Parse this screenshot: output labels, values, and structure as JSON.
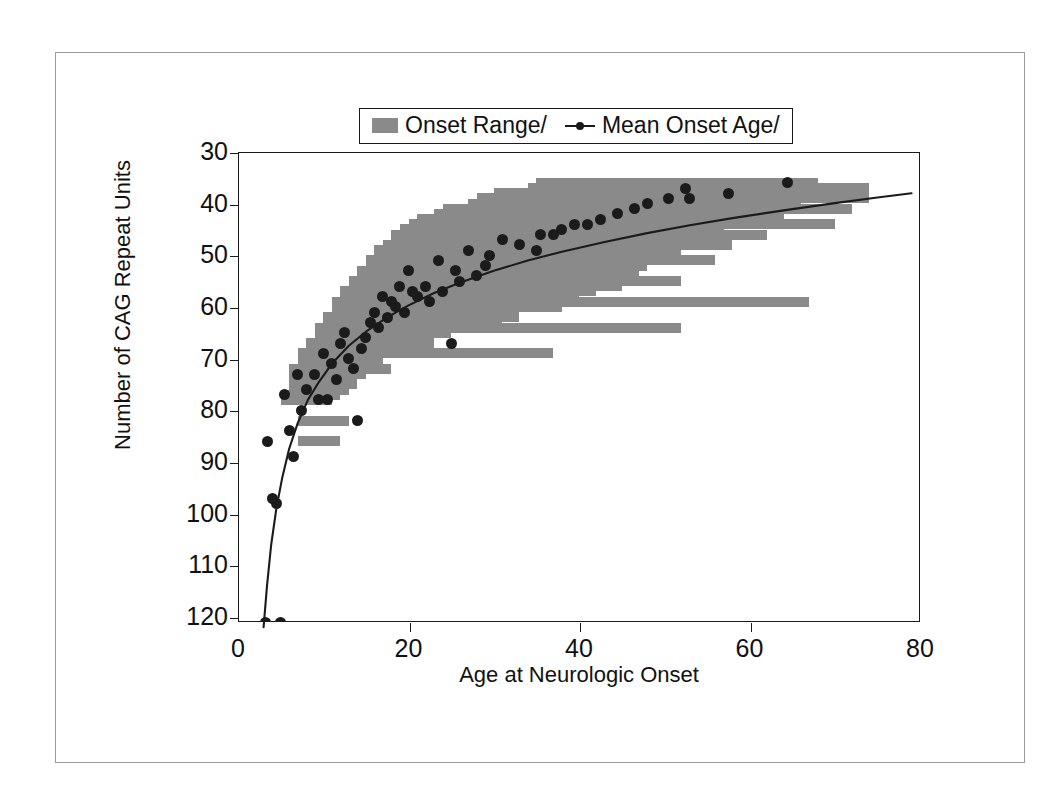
{
  "figure": {
    "background": "#ffffff",
    "frame_color": "#9a9a9a",
    "axis_color": "#1a1a1a"
  },
  "legend": {
    "position": "top-center",
    "items": [
      {
        "label": "Onset Range/",
        "marker": "swatch",
        "color": "#8a8a8a"
      },
      {
        "label": "Mean Onset Age/",
        "marker": "line-point",
        "color": "#1b1b1b"
      }
    ]
  },
  "chart_data": {
    "type": "scatter",
    "title": "",
    "xlabel": "Age at Neurologic Onset",
    "ylabel": "Number of CAG Repeat Units",
    "xlim": [
      0,
      80
    ],
    "ylim": [
      30,
      121
    ],
    "y_inverted": true,
    "grid": false,
    "xticks": [
      0,
      20,
      40,
      60,
      80
    ],
    "yticks": [
      30,
      40,
      50,
      60,
      70,
      80,
      90,
      100,
      110,
      120
    ],
    "bar_color": "#8a8a8a",
    "point_color": "#1b1b1b",
    "line_color": "#1b1b1b",
    "series": [
      {
        "name": "Onset Range/",
        "type": "range-bars",
        "note": "Horizontal age-range bar for each CAG repeat length",
        "bars": [
          {
            "cag": 36,
            "age_min": 35.0,
            "age_max": 68.0
          },
          {
            "cag": 37,
            "age_min": 34.0,
            "age_max": 74.0
          },
          {
            "cag": 38,
            "age_min": 30.0,
            "age_max": 72.0
          },
          {
            "cag": 39,
            "age_min": 28.0,
            "age_max": 74.0
          },
          {
            "cag": 40,
            "age_min": 27.0,
            "age_max": 66.0
          },
          {
            "cag": 41,
            "age_min": 24.0,
            "age_max": 72.0
          },
          {
            "cag": 42,
            "age_min": 23.0,
            "age_max": 60.0
          },
          {
            "cag": 43,
            "age_min": 21.0,
            "age_max": 64.0
          },
          {
            "cag": 44,
            "age_min": 20.0,
            "age_max": 70.0
          },
          {
            "cag": 45,
            "age_min": 19.0,
            "age_max": 57.0
          },
          {
            "cag": 46,
            "age_min": 18.0,
            "age_max": 62.0
          },
          {
            "cag": 47,
            "age_min": 18.0,
            "age_max": 55.0
          },
          {
            "cag": 48,
            "age_min": 17.0,
            "age_max": 58.0
          },
          {
            "cag": 49,
            "age_min": 16.0,
            "age_max": 52.0
          },
          {
            "cag": 50,
            "age_min": 16.0,
            "age_max": 50.0
          },
          {
            "cag": 51,
            "age_min": 15.0,
            "age_max": 56.0
          },
          {
            "cag": 52,
            "age_min": 15.0,
            "age_max": 48.0
          },
          {
            "cag": 53,
            "age_min": 14.0,
            "age_max": 47.0
          },
          {
            "cag": 54,
            "age_min": 14.0,
            "age_max": 44.0
          },
          {
            "cag": 55,
            "age_min": 13.0,
            "age_max": 52.0
          },
          {
            "cag": 56,
            "age_min": 13.0,
            "age_max": 45.0
          },
          {
            "cag": 57,
            "age_min": 12.0,
            "age_max": 42.0
          },
          {
            "cag": 58,
            "age_min": 12.0,
            "age_max": 40.0
          },
          {
            "cag": 59,
            "age_min": 11.0,
            "age_max": 67.0
          },
          {
            "cag": 60,
            "age_min": 11.0,
            "age_max": 38.0
          },
          {
            "cag": 61,
            "age_min": 11.0,
            "age_max": 27.0
          },
          {
            "cag": 62,
            "age_min": 10.0,
            "age_max": 33.0
          },
          {
            "cag": 63,
            "age_min": 10.0,
            "age_max": 31.0
          },
          {
            "cag": 64,
            "age_min": 9.0,
            "age_max": 52.0
          },
          {
            "cag": 65,
            "age_min": 9.0,
            "age_max": 25.0
          },
          {
            "cag": 66,
            "age_min": 9.0,
            "age_max": 20.0
          },
          {
            "cag": 67,
            "age_min": 8.0,
            "age_max": 23.0
          },
          {
            "cag": 68,
            "age_min": 8.0,
            "age_max": 19.0
          },
          {
            "cag": 69,
            "age_min": 7.0,
            "age_max": 37.0
          },
          {
            "cag": 70,
            "age_min": 7.0,
            "age_max": 17.0
          },
          {
            "cag": 71,
            "age_min": 7.0,
            "age_max": 16.0
          },
          {
            "cag": 72,
            "age_min": 6.0,
            "age_max": 18.0
          },
          {
            "cag": 73,
            "age_min": 6.0,
            "age_max": 15.0
          },
          {
            "cag": 75,
            "age_min": 6.0,
            "age_max": 14.0
          },
          {
            "cag": 76,
            "age_min": 6.0,
            "age_max": 13.0
          },
          {
            "cag": 77,
            "age_min": 5.0,
            "age_max": 12.0
          },
          {
            "cag": 78,
            "age_min": 5.0,
            "age_max": 11.0
          },
          {
            "cag": 82,
            "age_min": 7.0,
            "age_max": 13.0
          },
          {
            "cag": 86,
            "age_min": 7.0,
            "age_max": 12.0
          }
        ]
      },
      {
        "name": "Mean Onset Age/",
        "type": "points",
        "note": "Mean age at onset for each CAG repeat length",
        "points": [
          {
            "age": 64.5,
            "cag": 36
          },
          {
            "age": 52.5,
            "cag": 37
          },
          {
            "age": 57.5,
            "cag": 38
          },
          {
            "age": 53.0,
            "cag": 39
          },
          {
            "age": 50.5,
            "cag": 39
          },
          {
            "age": 48.0,
            "cag": 40
          },
          {
            "age": 46.5,
            "cag": 41
          },
          {
            "age": 44.5,
            "cag": 42
          },
          {
            "age": 42.5,
            "cag": 43
          },
          {
            "age": 41.0,
            "cag": 44
          },
          {
            "age": 39.5,
            "cag": 44
          },
          {
            "age": 38.0,
            "cag": 45
          },
          {
            "age": 37.0,
            "cag": 46
          },
          {
            "age": 35.5,
            "cag": 46
          },
          {
            "age": 35.0,
            "cag": 49
          },
          {
            "age": 33.0,
            "cag": 48
          },
          {
            "age": 31.0,
            "cag": 47
          },
          {
            "age": 29.5,
            "cag": 50
          },
          {
            "age": 29.0,
            "cag": 52
          },
          {
            "age": 28.0,
            "cag": 54
          },
          {
            "age": 27.0,
            "cag": 49
          },
          {
            "age": 26.0,
            "cag": 55
          },
          {
            "age": 25.5,
            "cag": 53
          },
          {
            "age": 25.0,
            "cag": 67
          },
          {
            "age": 24.0,
            "cag": 57
          },
          {
            "age": 23.5,
            "cag": 51
          },
          {
            "age": 22.5,
            "cag": 59
          },
          {
            "age": 22.0,
            "cag": 56
          },
          {
            "age": 21.0,
            "cag": 58
          },
          {
            "age": 20.5,
            "cag": 57
          },
          {
            "age": 20.0,
            "cag": 53
          },
          {
            "age": 19.5,
            "cag": 61
          },
          {
            "age": 19.0,
            "cag": 56
          },
          {
            "age": 18.5,
            "cag": 60
          },
          {
            "age": 18.0,
            "cag": 59
          },
          {
            "age": 17.5,
            "cag": 62
          },
          {
            "age": 17.0,
            "cag": 58
          },
          {
            "age": 16.5,
            "cag": 64
          },
          {
            "age": 16.0,
            "cag": 61
          },
          {
            "age": 15.5,
            "cag": 63
          },
          {
            "age": 15.0,
            "cag": 66
          },
          {
            "age": 14.5,
            "cag": 68
          },
          {
            "age": 14.0,
            "cag": 82
          },
          {
            "age": 13.5,
            "cag": 72
          },
          {
            "age": 13.0,
            "cag": 70
          },
          {
            "age": 12.5,
            "cag": 65
          },
          {
            "age": 12.0,
            "cag": 67
          },
          {
            "age": 11.5,
            "cag": 74
          },
          {
            "age": 11.0,
            "cag": 71
          },
          {
            "age": 10.5,
            "cag": 78
          },
          {
            "age": 10.0,
            "cag": 69
          },
          {
            "age": 9.5,
            "cag": 78
          },
          {
            "age": 9.0,
            "cag": 73
          },
          {
            "age": 8.0,
            "cag": 76
          },
          {
            "age": 7.5,
            "cag": 80
          },
          {
            "age": 7.0,
            "cag": 73
          },
          {
            "age": 6.5,
            "cag": 89
          },
          {
            "age": 6.0,
            "cag": 84
          },
          {
            "age": 5.5,
            "cag": 77
          },
          {
            "age": 5.0,
            "cag": 121
          },
          {
            "age": 4.5,
            "cag": 98
          },
          {
            "age": 4.0,
            "cag": 97
          },
          {
            "age": 3.5,
            "cag": 86
          },
          {
            "age": 3.2,
            "cag": 121
          }
        ]
      },
      {
        "name": "fit-curve",
        "type": "line",
        "note": "Fitted logarithmic trend of CAG repeat length vs age at onset",
        "points": [
          {
            "age": 3.0,
            "cag": 122.0
          },
          {
            "age": 3.4,
            "cag": 114.0
          },
          {
            "age": 3.9,
            "cag": 106.0
          },
          {
            "age": 4.5,
            "cag": 99.0
          },
          {
            "age": 5.2,
            "cag": 93.0
          },
          {
            "age": 6.0,
            "cag": 87.5
          },
          {
            "age": 7.0,
            "cag": 82.5
          },
          {
            "age": 8.2,
            "cag": 78.0
          },
          {
            "age": 9.5,
            "cag": 74.5
          },
          {
            "age": 11.0,
            "cag": 71.0
          },
          {
            "age": 13.0,
            "cag": 67.5
          },
          {
            "age": 15.0,
            "cag": 64.8
          },
          {
            "age": 17.5,
            "cag": 62.0
          },
          {
            "age": 20.0,
            "cag": 59.7
          },
          {
            "age": 23.0,
            "cag": 57.3
          },
          {
            "age": 26.0,
            "cag": 55.3
          },
          {
            "age": 30.0,
            "cag": 53.0
          },
          {
            "age": 34.0,
            "cag": 51.0
          },
          {
            "age": 38.0,
            "cag": 49.3
          },
          {
            "age": 43.0,
            "cag": 47.4
          },
          {
            "age": 48.0,
            "cag": 45.7
          },
          {
            "age": 53.0,
            "cag": 44.2
          },
          {
            "age": 58.0,
            "cag": 42.8
          },
          {
            "age": 64.0,
            "cag": 41.3
          },
          {
            "age": 70.0,
            "cag": 39.9
          },
          {
            "age": 75.0,
            "cag": 38.8
          },
          {
            "age": 79.0,
            "cag": 38.0
          }
        ]
      }
    ]
  }
}
